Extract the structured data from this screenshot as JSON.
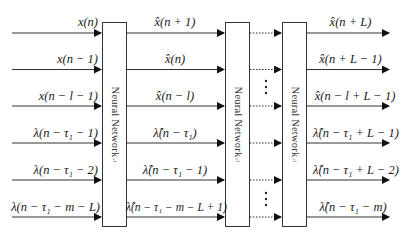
{
  "diagram": {
    "block_label": "Neural Network",
    "paragraph_mark": "↵",
    "vertical_ellipsis": "⋮",
    "inputs": [
      "x(n)",
      "x(n − 1)",
      "x(n − l − 1)",
      "λ(n − τ₁ − 1)",
      "λ(n − τ₁ − 2)",
      "λ(n − τ₁ − m − L)"
    ],
    "stage1_outputs": [
      "x̂(n + 1)",
      "x̂(n)",
      "x̂(n − l)",
      "λ̂(n − τ₁)",
      "λ̂(n − τ₁ − 1)",
      "λ̂(n − τ₁ − m − L + 1)"
    ],
    "final_outputs": [
      "x̂(n + L)",
      "x̂(n + L − 1)",
      "x̂(n − l + L − 1)",
      "λ̂(n − τ₁ + L − 1)",
      "λ̂(n − τ₁ + L − 2)",
      "λ̂(n − τ₁ − m)"
    ]
  }
}
